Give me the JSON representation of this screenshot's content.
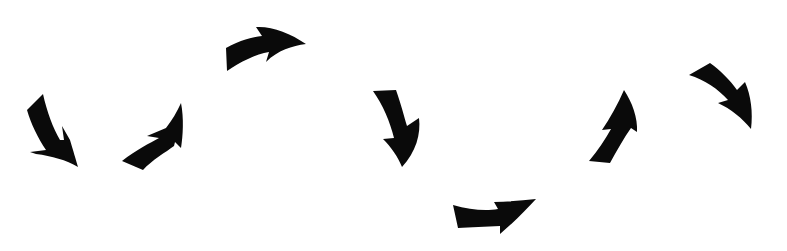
{
  "scene": {
    "title": "Curved arrows sequence",
    "background": "#ffffff",
    "arrow_color": "#0a0a0a",
    "arrow_count": 8
  },
  "arrows": [
    {
      "id": 1,
      "icon": "curved-arrow-down-icon",
      "direction": "down-right"
    },
    {
      "id": 2,
      "icon": "curved-arrow-up-icon",
      "direction": "up-right"
    },
    {
      "id": 3,
      "icon": "curved-arrow-right-icon",
      "direction": "right"
    },
    {
      "id": 4,
      "icon": "curved-arrow-down-icon",
      "direction": "down"
    },
    {
      "id": 5,
      "icon": "curved-arrow-right-icon",
      "direction": "right"
    },
    {
      "id": 6,
      "icon": "curved-arrow-up-icon",
      "direction": "up"
    },
    {
      "id": 7,
      "icon": "curved-arrow-down-icon",
      "direction": "down-right"
    }
  ]
}
